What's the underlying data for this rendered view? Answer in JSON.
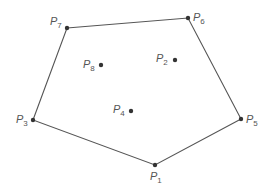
{
  "diagram": {
    "title": "",
    "hull_order": [
      "P7",
      "P6",
      "P5",
      "P1",
      "P3"
    ],
    "points": [
      {
        "id": "P1",
        "letter": "P",
        "index": "1",
        "x": 155,
        "y": 165,
        "on_hull": true,
        "label_dx": -5,
        "label_dy": 6
      },
      {
        "id": "P2",
        "letter": "P",
        "index": "2",
        "x": 175,
        "y": 60,
        "on_hull": false,
        "label_dx": -19,
        "label_dy": -7
      },
      {
        "id": "P3",
        "letter": "P",
        "index": "3",
        "x": 33,
        "y": 120,
        "on_hull": true,
        "label_dx": -17,
        "label_dy": -6
      },
      {
        "id": "P4",
        "letter": "P",
        "index": "4",
        "x": 131,
        "y": 111,
        "on_hull": false,
        "label_dx": -18,
        "label_dy": -7
      },
      {
        "id": "P5",
        "letter": "P",
        "index": "5",
        "x": 241,
        "y": 119,
        "on_hull": true,
        "label_dx": 5,
        "label_dy": -5
      },
      {
        "id": "P6",
        "letter": "P",
        "index": "6",
        "x": 188,
        "y": 18,
        "on_hull": true,
        "label_dx": 5,
        "label_dy": -6
      },
      {
        "id": "P7",
        "letter": "P",
        "index": "7",
        "x": 67,
        "y": 28,
        "on_hull": true,
        "label_dx": -17,
        "label_dy": -12
      },
      {
        "id": "P8",
        "letter": "P",
        "index": "8",
        "x": 101,
        "y": 65,
        "on_hull": false,
        "label_dx": -18,
        "label_dy": -6
      }
    ]
  },
  "colors": {
    "edge": "#555555",
    "dot": "#333333",
    "label": "#555555",
    "background": "#ffffff"
  }
}
